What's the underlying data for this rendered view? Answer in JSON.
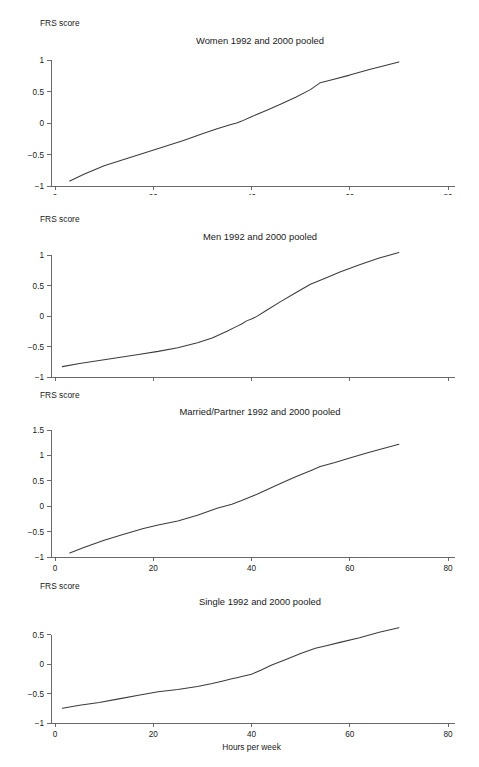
{
  "figure": {
    "background": "#ffffff",
    "line_color": "#3c3c3c",
    "axis_color": "#5a5a5a",
    "width": 479,
    "height": 767
  },
  "chart_data": [
    {
      "type": "line",
      "title": "Women 1992 and 2000 pooled",
      "xlabel": "Hours per week",
      "ylabel": "FRS score",
      "xlim": [
        0,
        80
      ],
      "ylim": [
        -1,
        1
      ],
      "xticks": [
        0,
        20,
        40,
        60,
        80
      ],
      "xticklabels": [
        "0",
        "20",
        "40",
        "60",
        "80"
      ],
      "yticks": [
        -1,
        -0.5,
        0,
        0.5,
        1
      ],
      "yticklabels": [
        "-1",
        "-0.5",
        "0",
        "0.5",
        "1"
      ],
      "grid": false,
      "legend": "none",
      "x": [
        3,
        6,
        10,
        14,
        18,
        22,
        26,
        30,
        33,
        36,
        37,
        38,
        40,
        43,
        46,
        49,
        52,
        54,
        56,
        60,
        64,
        67,
        70
      ],
      "y": [
        -0.92,
        -0.81,
        -0.68,
        -0.58,
        -0.48,
        -0.38,
        -0.28,
        -0.17,
        -0.09,
        -0.02,
        0.0,
        0.03,
        0.1,
        0.2,
        0.3,
        0.41,
        0.53,
        0.64,
        0.68,
        0.76,
        0.85,
        0.91,
        0.97
      ]
    },
    {
      "type": "line",
      "title": "Men 1992 and 2000 pooled",
      "xlabel": "Hours per week",
      "ylabel": "FRS score",
      "xlim": [
        0,
        80
      ],
      "ylim": [
        -1,
        1
      ],
      "xticks": [
        0,
        20,
        40,
        60,
        80
      ],
      "xticklabels": [
        "0",
        "20",
        "40",
        "60",
        "80"
      ],
      "yticks": [
        -1,
        -0.5,
        0,
        0.5,
        1
      ],
      "yticklabels": [
        "-1",
        "-0.5",
        "0",
        "0.5",
        "1"
      ],
      "grid": false,
      "legend": "none",
      "x": [
        1.5,
        5,
        9,
        13,
        17,
        21,
        25,
        29,
        32,
        35,
        37,
        38,
        39,
        40,
        41,
        43,
        46,
        49,
        52,
        55,
        58,
        62,
        66,
        70
      ],
      "y": [
        -0.83,
        -0.78,
        -0.73,
        -0.68,
        -0.63,
        -0.58,
        -0.52,
        -0.44,
        -0.36,
        -0.25,
        -0.17,
        -0.13,
        -0.08,
        -0.05,
        -0.01,
        0.09,
        0.24,
        0.38,
        0.52,
        0.62,
        0.72,
        0.84,
        0.95,
        1.04
      ]
    },
    {
      "type": "line",
      "title": "Married/Partner 1992 and 2000 pooled",
      "xlabel": "Hours per week",
      "ylabel": "FRS score",
      "xlim": [
        0,
        80
      ],
      "ylim": [
        -1,
        1.5
      ],
      "xticks": [
        0,
        20,
        40,
        60,
        80
      ],
      "xticklabels": [
        "0",
        "20",
        "40",
        "60",
        "80"
      ],
      "yticks": [
        -1,
        -0.5,
        0,
        0.5,
        1,
        1.5
      ],
      "yticklabels": [
        "-1",
        "-0.5",
        "0",
        "0.5",
        "1",
        "1.5"
      ],
      "grid": false,
      "legend": "none",
      "x": [
        3,
        6,
        10,
        14,
        18,
        21,
        25,
        29,
        33,
        36,
        38,
        40,
        41,
        43,
        46,
        49,
        52,
        54,
        57,
        60,
        64,
        67,
        70
      ],
      "y": [
        -0.92,
        -0.81,
        -0.67,
        -0.55,
        -0.44,
        -0.37,
        -0.29,
        -0.18,
        -0.04,
        0.04,
        0.11,
        0.19,
        0.23,
        0.32,
        0.45,
        0.58,
        0.7,
        0.78,
        0.86,
        0.95,
        1.06,
        1.14,
        1.22
      ]
    },
    {
      "type": "line",
      "title": "Single 1992 and 2000 pooled",
      "xlabel": "Hours per week",
      "ylabel": "FRS score",
      "xlim": [
        0,
        80
      ],
      "ylim": [
        -1,
        0.75
      ],
      "xticks": [
        0,
        20,
        40,
        60,
        80
      ],
      "xticklabels": [
        "0",
        "20",
        "40",
        "60",
        "80"
      ],
      "yticks": [
        -1,
        -0.5,
        0,
        0.5
      ],
      "yticklabels": [
        "-1",
        "-0.5",
        "0",
        "0.5"
      ],
      "grid": false,
      "legend": "none",
      "x": [
        1.5,
        5,
        9,
        13,
        17,
        21,
        25,
        29,
        32,
        34,
        35,
        36,
        37,
        38,
        40,
        42,
        44,
        47,
        50,
        53,
        55,
        58,
        62,
        66,
        70
      ],
      "y": [
        -0.75,
        -0.7,
        -0.65,
        -0.59,
        -0.53,
        -0.47,
        -0.43,
        -0.38,
        -0.33,
        -0.29,
        -0.27,
        -0.25,
        -0.23,
        -0.21,
        -0.17,
        -0.1,
        -0.02,
        0.08,
        0.18,
        0.27,
        0.31,
        0.37,
        0.45,
        0.54,
        0.62
      ]
    }
  ]
}
